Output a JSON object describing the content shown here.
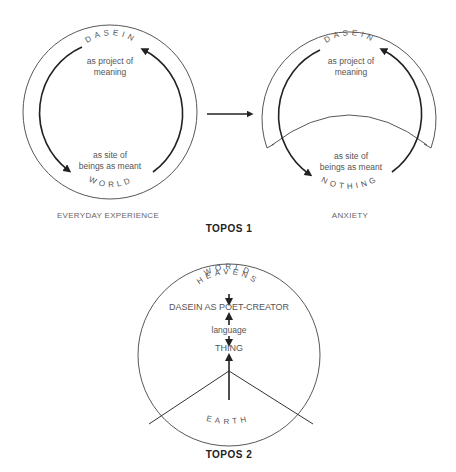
{
  "topos1": {
    "title": "TOPOS 1",
    "left": {
      "caption": "EVERYDAY EXPERIENCE",
      "top_arc_label": "DASEIN",
      "top_text_line1": "as project of",
      "top_text_line2": "meaning",
      "bottom_text_line1": "as site of",
      "bottom_text_line2": "beings as meant",
      "bottom_arc_label": "WORLD"
    },
    "right": {
      "caption": "ANXIETY",
      "top_arc_label": "DASEIN",
      "top_text_line1": "as project of",
      "top_text_line2": "meaning",
      "bottom_text_line1": "as site of",
      "bottom_text_line2": "beings as meant",
      "bottom_arc_label": "NOTHING"
    }
  },
  "topos2": {
    "title": "TOPOS 2",
    "arc_label_1": "WORLD",
    "arc_label_2": "HEAVENS",
    "node_dasein": "DASEIN AS POET-CREATOR",
    "node_language": "language",
    "node_thing": "THING",
    "arc_label_earth": "EARTH"
  },
  "colors": {
    "line": "#333333",
    "text": "#555555",
    "title": "#222222"
  }
}
